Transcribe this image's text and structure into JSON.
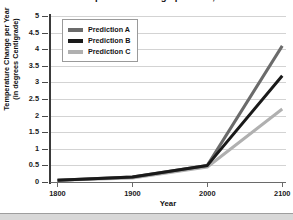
{
  "chart_data": {
    "type": "line",
    "title": "Predicted Temperature Change per Year, 1800-2100",
    "xlabel": "Year",
    "ylabel_line1": "Temperature Change per Year",
    "ylabel_line2": "(in degrees Centigrade)",
    "x": [
      1800,
      1900,
      2000,
      2100
    ],
    "xlim": [
      1790,
      2105
    ],
    "xticks": [
      1800,
      1900,
      2000,
      2100
    ],
    "xticklabels": [
      "1800",
      "1900",
      "2000",
      "2100"
    ],
    "ylim": [
      0,
      5
    ],
    "yticks": [
      0,
      0.5,
      1,
      1.5,
      2,
      2.5,
      3,
      3.5,
      4,
      4.5,
      5
    ],
    "yticklabels": [
      "0",
      "0.5",
      "1",
      "1.5",
      "2",
      "2.5",
      "3",
      "3.5",
      "4",
      "4.5",
      "5"
    ],
    "grid": true,
    "legend_position": "upper-left",
    "series": [
      {
        "name": "Prediction A",
        "color": "#6b6b6b",
        "values": [
          0.05,
          0.15,
          0.5,
          4.1
        ]
      },
      {
        "name": "Prediction B",
        "color": "#1a1a1a",
        "values": [
          0.05,
          0.15,
          0.5,
          3.2
        ]
      },
      {
        "name": "Prediction C",
        "color": "#b0b0b0",
        "values": [
          0.05,
          0.12,
          0.45,
          2.2
        ]
      }
    ]
  },
  "legend": {
    "items": [
      {
        "label": "Prediction A",
        "color": "#6b6b6b"
      },
      {
        "label": "Prediction B",
        "color": "#1a1a1a"
      },
      {
        "label": "Prediction C",
        "color": "#b0b0b0"
      }
    ]
  }
}
